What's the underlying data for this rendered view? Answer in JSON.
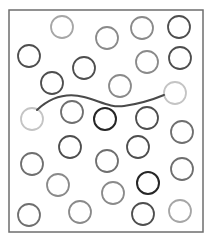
{
  "diagram": {
    "frame": {
      "x": 9,
      "y": 10,
      "width": 194,
      "height": 222,
      "stroke": "#6e6e6e"
    },
    "circle_radius": 11,
    "shades": {
      "very_light": "#c4c4c4",
      "light": "#a6a6a6",
      "medium": "#8a8a8a",
      "medium_dark": "#6f6f6f",
      "dark": "#4e4e4e",
      "very_dark": "#262626"
    },
    "circles": [
      {
        "cx": 62,
        "cy": 27,
        "shade": "light"
      },
      {
        "cx": 107,
        "cy": 38,
        "shade": "medium"
      },
      {
        "cx": 142,
        "cy": 28,
        "shade": "medium"
      },
      {
        "cx": 179,
        "cy": 27,
        "shade": "dark"
      },
      {
        "cx": 29,
        "cy": 56,
        "shade": "dark"
      },
      {
        "cx": 147,
        "cy": 62,
        "shade": "medium"
      },
      {
        "cx": 180,
        "cy": 58,
        "shade": "dark"
      },
      {
        "cx": 84,
        "cy": 68,
        "shade": "dark"
      },
      {
        "cx": 52,
        "cy": 83,
        "shade": "dark"
      },
      {
        "cx": 120,
        "cy": 86,
        "shade": "medium"
      },
      {
        "cx": 175,
        "cy": 93,
        "shade": "very_light"
      },
      {
        "cx": 32,
        "cy": 119,
        "shade": "very_light"
      },
      {
        "cx": 72,
        "cy": 112,
        "shade": "medium_dark"
      },
      {
        "cx": 105,
        "cy": 119,
        "shade": "very_dark"
      },
      {
        "cx": 147,
        "cy": 118,
        "shade": "dark"
      },
      {
        "cx": 182,
        "cy": 132,
        "shade": "medium_dark"
      },
      {
        "cx": 70,
        "cy": 147,
        "shade": "dark"
      },
      {
        "cx": 138,
        "cy": 147,
        "shade": "dark"
      },
      {
        "cx": 32,
        "cy": 164,
        "shade": "medium_dark"
      },
      {
        "cx": 107,
        "cy": 161,
        "shade": "medium_dark"
      },
      {
        "cx": 182,
        "cy": 169,
        "shade": "medium_dark"
      },
      {
        "cx": 58,
        "cy": 185,
        "shade": "medium"
      },
      {
        "cx": 148,
        "cy": 183,
        "shade": "very_dark"
      },
      {
        "cx": 113,
        "cy": 193,
        "shade": "medium"
      },
      {
        "cx": 29,
        "cy": 215,
        "shade": "medium_dark"
      },
      {
        "cx": 80,
        "cy": 212,
        "shade": "medium"
      },
      {
        "cx": 143,
        "cy": 214,
        "shade": "dark"
      },
      {
        "cx": 180,
        "cy": 211,
        "shade": "light"
      }
    ],
    "connector": {
      "from_circle": 11,
      "to_circle": 10,
      "path": "M 37 110 C 52 96, 68 93, 84 97 S 110 108, 124 106 S 152 100, 164 95",
      "stroke": "#4a4a4a",
      "stroke_width": 2
    }
  }
}
